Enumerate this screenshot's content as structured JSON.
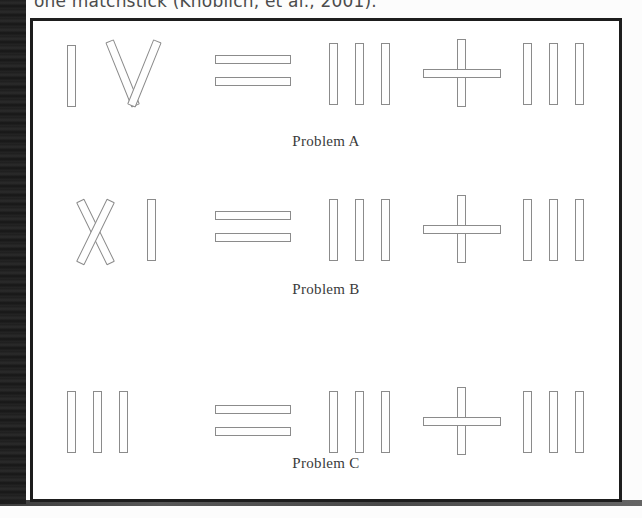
{
  "caption_top": {
    "text": "one matchstick (Knoblich, et al., 2001)."
  },
  "figure": {
    "problems": [
      {
        "id": "A",
        "label": "Problem A",
        "equation_text": "IV = III + III",
        "left_numeral": "IV",
        "operator_equals": "=",
        "middle_numeral": "III",
        "operator_plus": "+",
        "right_numeral": "III"
      },
      {
        "id": "B",
        "label": "Problem B",
        "equation_text": "XI = III + III",
        "left_numeral": "XI",
        "operator_equals": "=",
        "middle_numeral": "III",
        "operator_plus": "+",
        "right_numeral": "III"
      },
      {
        "id": "C",
        "label": "Problem C",
        "equation_text": "III = III + III",
        "left_numeral": "III",
        "operator_equals": "=",
        "middle_numeral": "III",
        "operator_plus": "+",
        "right_numeral": "III"
      }
    ]
  },
  "colors": {
    "stick_fill": "#fefefe",
    "stick_stroke": "#8b8b8b",
    "frame_border": "#1d1d1d",
    "page_background": "#fcfcfc",
    "scan_gutter": "#141414",
    "label_text": "#3a3a3a",
    "caption_text": "#4b4b4b"
  }
}
